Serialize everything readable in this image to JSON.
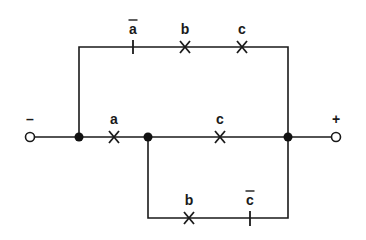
{
  "diagram": {
    "type": "switching-circuit",
    "terminals": {
      "left": {
        "label": "–",
        "polarity": "negative"
      },
      "right": {
        "label": "+",
        "polarity": "positive"
      }
    },
    "branches": {
      "top": {
        "contacts": [
          {
            "label": "a",
            "negated": true,
            "kind": "normally-closed"
          },
          {
            "label": "b",
            "negated": false,
            "kind": "normally-open"
          },
          {
            "label": "c",
            "negated": false,
            "kind": "normally-open"
          }
        ]
      },
      "middle": {
        "contacts": [
          {
            "label": "a",
            "negated": false,
            "kind": "normally-open"
          },
          {
            "label": "c",
            "negated": false,
            "kind": "normally-open"
          }
        ]
      },
      "bottom": {
        "contacts": [
          {
            "label": "b",
            "negated": false,
            "kind": "normally-open"
          },
          {
            "label": "c",
            "negated": true,
            "kind": "normally-closed"
          }
        ]
      }
    },
    "colors": {
      "line": "#1a1a1a",
      "background": "#ffffff"
    }
  }
}
